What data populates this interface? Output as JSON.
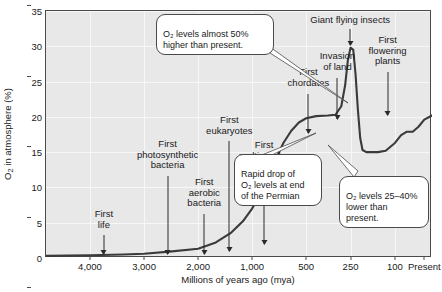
{
  "chart_data": {
    "type": "line",
    "title": "",
    "xlabel": "Millions of years ago (mya)",
    "ylabel": "O₂ in atmosphere (%)",
    "ylim": [
      0,
      35
    ],
    "yticks": [
      0,
      5,
      10,
      15,
      20,
      25,
      30,
      35
    ],
    "xtick_labels": [
      "4,000",
      "3,000",
      "2,000",
      "1,000",
      "500",
      "250",
      "100",
      "Present"
    ],
    "xtick_positions_pct": [
      11.4,
      25.4,
      39.4,
      53.4,
      67.4,
      78.9,
      90.4,
      98.0
    ],
    "x_axis_note": "non-linear compressed time scale",
    "grid": true,
    "legend": null,
    "series": [
      {
        "name": "Atmospheric O₂",
        "color": "#3a3a3a",
        "points_pct": [
          [
            0.0,
            0.3
          ],
          [
            11.4,
            0.4
          ],
          [
            20.0,
            0.5
          ],
          [
            25.4,
            0.6
          ],
          [
            32.0,
            0.9
          ],
          [
            39.4,
            1.3
          ],
          [
            44.0,
            2.2
          ],
          [
            48.0,
            3.6
          ],
          [
            51.0,
            5.2
          ],
          [
            53.4,
            7.0
          ],
          [
            55.5,
            9.0
          ],
          [
            57.5,
            11.5
          ],
          [
            59.5,
            14.0
          ],
          [
            61.5,
            16.3
          ],
          [
            63.5,
            18.0
          ],
          [
            65.5,
            19.2
          ],
          [
            67.4,
            19.8
          ],
          [
            70.0,
            20.1
          ],
          [
            73.0,
            20.2
          ],
          [
            75.0,
            20.3
          ],
          [
            76.5,
            21.5
          ],
          [
            77.5,
            24.5
          ],
          [
            78.2,
            28.0
          ],
          [
            78.9,
            29.8
          ],
          [
            79.6,
            29.5
          ],
          [
            80.2,
            26.0
          ],
          [
            80.8,
            21.0
          ],
          [
            81.4,
            17.0
          ],
          [
            82.0,
            15.3
          ],
          [
            83.0,
            15.0
          ],
          [
            86.0,
            15.0
          ],
          [
            88.0,
            15.2
          ],
          [
            90.4,
            16.3
          ],
          [
            92.0,
            17.4
          ],
          [
            93.5,
            17.9
          ],
          [
            95.0,
            17.9
          ],
          [
            96.5,
            18.6
          ],
          [
            98.0,
            19.6
          ],
          [
            100.0,
            20.2
          ]
        ]
      }
    ],
    "events": [
      {
        "label": "First\nlife",
        "x_pct": 15.0
      },
      {
        "label": "First\nphotosynthetic\nbacteria",
        "x_pct": 31.5
      },
      {
        "label": "First\naerobic\nbacteria",
        "x_pct": 41.0
      },
      {
        "label": "First\neukaryotes",
        "x_pct": 47.5
      },
      {
        "label": "First\nmulticellular\neukaryotes",
        "x_pct": 56.5
      },
      {
        "label": "First\nchordates",
        "x_pct": 68.0
      },
      {
        "label": "Invasion\nof land",
        "x_pct": 75.5
      },
      {
        "label": "Giant flying insects",
        "x_pct": 78.8
      },
      {
        "label": "First\nflowering\nplants",
        "x_pct": 88.5
      }
    ],
    "callouts": [
      {
        "text": "O₂ levels almost 50%\nhigher than present."
      },
      {
        "text": "Rapid drop of\nO₂ levels at end\nof the Permian"
      },
      {
        "text": "O₂ levels 25–40%\nlower than present."
      }
    ]
  }
}
